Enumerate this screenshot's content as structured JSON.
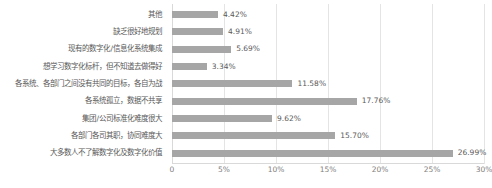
{
  "chart_data": {
    "type": "bar",
    "orientation": "horizontal",
    "title": "",
    "xlabel": "",
    "ylabel": "",
    "xlim": [
      0,
      30
    ],
    "grid": true,
    "legend": false,
    "bar_color": "#a6a6a6",
    "gridline_color": "#e4e4e4",
    "axis_color": "#d9d9d9",
    "label_color": "#595959",
    "value_suffix": "%",
    "xticks": [
      "0",
      "5%",
      "10%",
      "15%",
      "20%",
      "25%",
      "30%"
    ],
    "xtick_values": [
      0,
      5,
      10,
      15,
      20,
      25,
      30
    ],
    "categories": [
      "其他",
      "缺乏很好地规划",
      "现有的数字化/信息化系统集成",
      "想学习数字化标杆，但不知道去做得好",
      "各系统、各部门之间没有共同的目标，各自为战",
      "各系统孤立，数据不共享",
      "集团/公司标准化难度很大",
      "各部门各司其职，协同难度大",
      "大多数人不了解数字化及数字化价值"
    ],
    "values": [
      4.42,
      4.91,
      5.69,
      3.34,
      11.58,
      17.76,
      9.62,
      15.7,
      26.99
    ],
    "value_labels": [
      "4.42%",
      "4.91%",
      "5.69%",
      "3.34%",
      "11.58%",
      "17.76%",
      "9.62%",
      "15.70%",
      "26.99%"
    ]
  }
}
